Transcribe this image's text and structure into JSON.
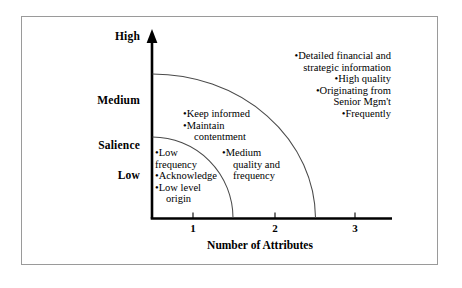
{
  "figure": {
    "type": "quadrant-arc-diagram",
    "axes": {
      "y_title": "Salience",
      "y_ticks": [
        "High",
        "Medium",
        "Low"
      ],
      "x_title": "Number of Attributes",
      "x_ticks": [
        "1",
        "2",
        "3"
      ]
    },
    "zones": [
      {
        "name": "inner",
        "lines": [
          "•Low",
          "frequency",
          "•Acknowledge",
          "•Low level",
          "origin"
        ]
      },
      {
        "name": "middle-upper",
        "lines": [
          "•Keep informed",
          "•Maintain",
          "contentment"
        ]
      },
      {
        "name": "middle-lower",
        "lines": [
          "•Medium",
          "quality and",
          "frequency"
        ]
      },
      {
        "name": "outer",
        "lines": [
          "•Detailed financial and",
          "strategic information",
          "•High quality",
          "•Originating from",
          "Senior Mgm't",
          "•Frequently"
        ]
      }
    ],
    "colors": {
      "ink": "#000000",
      "frame": "#9a9a9a",
      "arc": "#4a4a4a"
    }
  }
}
